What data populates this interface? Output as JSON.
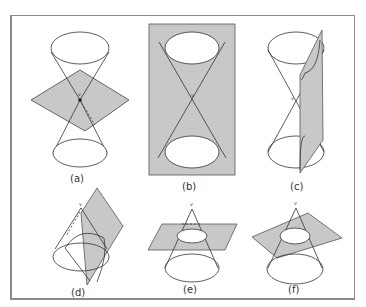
{
  "figure": {
    "vertex_label": "v",
    "panels": [
      {
        "id": "a",
        "label": "(a)"
      },
      {
        "id": "b",
        "label": "(b)"
      },
      {
        "id": "c",
        "label": "(c)"
      },
      {
        "id": "d",
        "label": "(d)"
      },
      {
        "id": "e",
        "label": "(e)"
      },
      {
        "id": "f",
        "label": "(f)"
      }
    ]
  },
  "colors": {
    "plane_fill": "#c8c8c8",
    "line": "#333333",
    "frame": "#8a8a8a"
  }
}
